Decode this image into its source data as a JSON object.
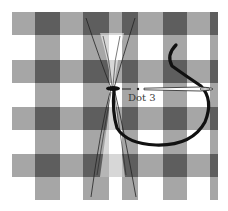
{
  "illustration": {
    "subject": "Gathered gingham fabric with needle and thread",
    "label": "Dot 3",
    "colors": {
      "background": "#ffffff",
      "stripe": "#a6a6a6",
      "intersection": "#5e5e5e",
      "thread": "#111111",
      "outline": "#222222",
      "needle": "#ffffff"
    }
  }
}
